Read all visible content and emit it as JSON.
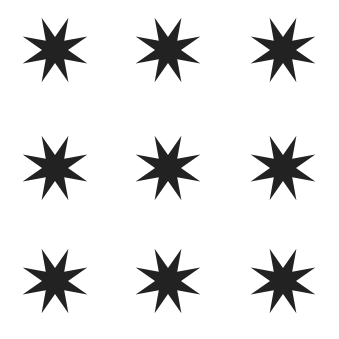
{
  "canvas": {
    "width": 339,
    "height": 339,
    "background": "#ffffff"
  },
  "shape": {
    "type": "8-pointed-star",
    "color": "#222222",
    "outer_radius": 35,
    "inner_radius": 13,
    "rotation_deg": 22.5
  },
  "grid": {
    "rows": 3,
    "cols": 3,
    "col_centers": [
      55,
      168,
      283
    ],
    "row_centers": [
      50,
      168,
      281
    ]
  }
}
